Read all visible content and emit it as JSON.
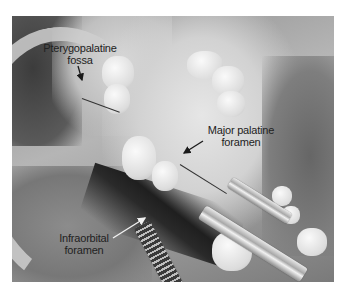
{
  "figure": {
    "background_color": "#ffffff",
    "annotations": [
      {
        "id": "pterygopalatine",
        "line1": "Pterygopalatine",
        "line2": "fossa",
        "text_color": "#222222",
        "arrow_color": "#1a1a1a"
      },
      {
        "id": "major-palatine",
        "line1": "Major palatine",
        "line2": "foramen",
        "text_color": "#222222",
        "arrow_color": "#1a1a1a"
      },
      {
        "id": "infraorbital",
        "line1": "Infraorbital",
        "line2": "foramen",
        "text_color": "#222222",
        "arrow_color": "#f2f2f2"
      }
    ]
  }
}
